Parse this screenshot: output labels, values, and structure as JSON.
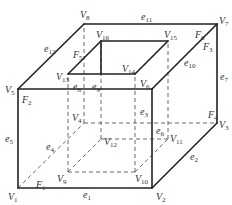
{
  "diagram": {
    "vertices": [
      {
        "id": "V1",
        "base": "V",
        "sub": "1",
        "x": 18,
        "y": 188,
        "lx": 8,
        "ly": 200
      },
      {
        "id": "V2",
        "base": "V",
        "sub": "2",
        "x": 152,
        "y": 188,
        "lx": 156,
        "ly": 200
      },
      {
        "id": "V3",
        "base": "V",
        "sub": "3",
        "x": 217,
        "y": 123,
        "lx": 219,
        "ly": 128
      },
      {
        "id": "V4",
        "base": "V",
        "sub": "4",
        "x": 84,
        "y": 123,
        "lx": 72,
        "ly": 121
      },
      {
        "id": "V5",
        "base": "V",
        "sub": "5",
        "x": 18,
        "y": 89,
        "lx": 5,
        "ly": 93
      },
      {
        "id": "V6",
        "base": "V",
        "sub": "6",
        "x": 152,
        "y": 89,
        "lx": 140,
        "ly": 87
      },
      {
        "id": "V7",
        "base": "V",
        "sub": "7",
        "x": 217,
        "y": 24,
        "lx": 219,
        "ly": 24
      },
      {
        "id": "V8",
        "base": "V",
        "sub": "8",
        "x": 84,
        "y": 24,
        "lx": 80,
        "ly": 18
      },
      {
        "id": "V9",
        "base": "V",
        "sub": "9",
        "x": 68,
        "y": 172,
        "lx": 57,
        "ly": 182
      },
      {
        "id": "V10",
        "base": "V",
        "sub": "10",
        "x": 135,
        "y": 172,
        "lx": 135,
        "ly": 182
      },
      {
        "id": "V11",
        "base": "V",
        "sub": "11",
        "x": 168,
        "y": 139,
        "lx": 170,
        "ly": 142
      },
      {
        "id": "V12",
        "base": "V",
        "sub": "12",
        "x": 101,
        "y": 139,
        "lx": 104,
        "ly": 145
      },
      {
        "id": "V13",
        "base": "V",
        "sub": "13",
        "x": 68,
        "y": 74,
        "lx": 56,
        "ly": 80
      },
      {
        "id": "V14",
        "base": "V",
        "sub": "14",
        "x": 135,
        "y": 74,
        "lx": 122,
        "ly": 72
      },
      {
        "id": "V15",
        "base": "V",
        "sub": "15",
        "x": 168,
        "y": 41,
        "lx": 164,
        "ly": 38
      },
      {
        "id": "V16",
        "base": "V",
        "sub": "16",
        "x": 101,
        "y": 41,
        "lx": 96,
        "ly": 38
      }
    ],
    "edge_labels": [
      {
        "id": "e1",
        "base": "e",
        "sub": "1",
        "x": 83,
        "y": 198
      },
      {
        "id": "e2",
        "base": "e",
        "sub": "2",
        "x": 190,
        "y": 160
      },
      {
        "id": "e3",
        "base": "e",
        "sub": "3",
        "x": 140,
        "y": 115
      },
      {
        "id": "e4",
        "base": "e",
        "sub": "4",
        "x": 46,
        "y": 150
      },
      {
        "id": "e5",
        "base": "e",
        "sub": "5",
        "x": 5,
        "y": 142
      },
      {
        "id": "e6",
        "base": "e",
        "sub": "6",
        "x": 156,
        "y": 134
      },
      {
        "id": "e7",
        "base": "e",
        "sub": "7",
        "x": 220,
        "y": 80
      },
      {
        "id": "e8",
        "base": "e",
        "sub": "8",
        "x": 73,
        "y": 90
      },
      {
        "id": "e9",
        "base": "e",
        "sub": "9",
        "x": 92,
        "y": 90
      },
      {
        "id": "e10",
        "base": "e",
        "sub": "10",
        "x": 184,
        "y": 66
      },
      {
        "id": "e11",
        "base": "e",
        "sub": "11",
        "x": 141,
        "y": 20
      },
      {
        "id": "e12",
        "base": "e",
        "sub": "12",
        "x": 44,
        "y": 52
      }
    ],
    "face_labels": [
      {
        "id": "F1",
        "base": "F",
        "sub": "1",
        "x": 36,
        "y": 188
      },
      {
        "id": "F2",
        "base": "F",
        "sub": "2",
        "x": 22,
        "y": 103
      },
      {
        "id": "F3",
        "base": "F",
        "sub": "3",
        "x": 203,
        "y": 50
      },
      {
        "id": "F4",
        "base": "F",
        "sub": "4",
        "x": 208,
        "y": 118
      },
      {
        "id": "F5",
        "base": "F",
        "sub": "5",
        "x": 73,
        "y": 58
      },
      {
        "id": "F6",
        "base": "F",
        "sub": "6",
        "x": 195,
        "y": 38
      }
    ],
    "solid_edges": [
      [
        "V1",
        "V2"
      ],
      [
        "V1",
        "V5"
      ],
      [
        "V5",
        "V6"
      ],
      [
        "V2",
        "V6"
      ],
      [
        "V5",
        "V8"
      ],
      [
        "V8",
        "V7"
      ],
      [
        "V6",
        "V7"
      ],
      [
        "V7",
        "V3"
      ],
      [
        "V2",
        "V3"
      ],
      [
        "V13",
        "V14"
      ],
      [
        "V13",
        "V16"
      ],
      [
        "V16",
        "V15"
      ],
      [
        "V14",
        "V15"
      ],
      [
        "V16",
        "V16b"
      ]
    ],
    "dashed_edges": [
      [
        "V1",
        "V4"
      ],
      [
        "V4",
        "V3"
      ],
      [
        "V4",
        "V8"
      ],
      [
        "V9",
        "V10"
      ],
      [
        "V9",
        "V12"
      ],
      [
        "V12",
        "V11"
      ],
      [
        "V10",
        "V11"
      ],
      [
        "V9",
        "V13"
      ],
      [
        "V10",
        "V14"
      ],
      [
        "V12",
        "V16"
      ],
      [
        "V11",
        "V15"
      ]
    ],
    "colors": {
      "line": "#222222",
      "dashed": "#444444",
      "text": "#333333",
      "background": "#ffffff"
    }
  }
}
